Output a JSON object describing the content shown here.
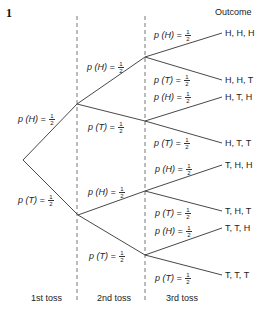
{
  "figure_number": "1",
  "header": {
    "outcome_label": "Outcome"
  },
  "stages": [
    "1st toss",
    "2nd toss",
    "3rd toss"
  ],
  "probability": {
    "num": "1",
    "den": "2"
  },
  "level1": [
    {
      "event": "H",
      "label": "p (H) = "
    },
    {
      "event": "T",
      "label": "p (T) = "
    }
  ],
  "level2": [
    {
      "event": "H",
      "label": "p (H) = "
    },
    {
      "event": "T",
      "label": "p (T) = "
    },
    {
      "event": "H",
      "label": "p (H) = "
    },
    {
      "event": "T",
      "label": "p (T) = "
    }
  ],
  "level3": [
    {
      "event": "H",
      "label": "p (H) = "
    },
    {
      "event": "T",
      "label": "p (T) = "
    },
    {
      "event": "H",
      "label": "p (H) = "
    },
    {
      "event": "T",
      "label": "p (T) = "
    },
    {
      "event": "H",
      "label": "p (H) = "
    },
    {
      "event": "T",
      "label": "p (T) = "
    },
    {
      "event": "H",
      "label": "p (H) = "
    },
    {
      "event": "T",
      "label": "p (T) = "
    }
  ],
  "outcomes": [
    "H, H, H",
    "H, H, T",
    "H, T, H",
    "H, T, T",
    "T, H, H",
    "T, H, T",
    "T, T, H",
    "T, T, T"
  ],
  "colors": {
    "line": "#333333",
    "dashed": "#555555",
    "text": "#222222"
  }
}
